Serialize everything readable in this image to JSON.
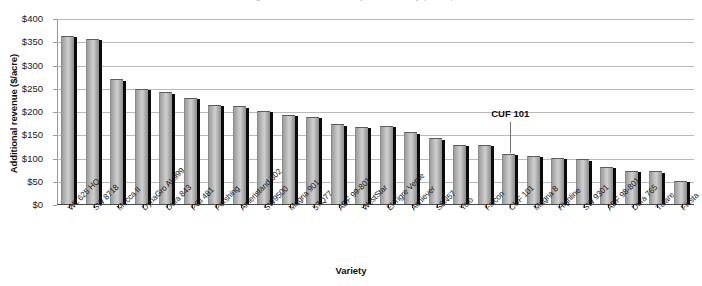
{
  "chart_data": {
    "type": "bar",
    "title": "",
    "xlabel": "Variety",
    "ylabel": "Additional revenue ($/acre)",
    "ylim": [
      0,
      400
    ],
    "ytick_step": 50,
    "ytick_labels": [
      "$0",
      "$50",
      "$100",
      "$150",
      "$200",
      "$250",
      "$300",
      "$350",
      "$400"
    ],
    "ytick_values": [
      0,
      50,
      100,
      150,
      200,
      250,
      300,
      350,
      400
    ],
    "grid": true,
    "legend": "none",
    "bar_color": "#bdbdbd",
    "bar_edge_color": "#5c5c5c",
    "bar_shadow_color": "#0b0b0b",
    "categories": [
      "WL 625 HQ",
      "SW 8718",
      "Mecca II",
      "DynaGro AL999",
      "Dura 843",
      "PGI 481",
      "Pershing",
      "Ameristand 802",
      "SW9500",
      "Magna 901",
      "57Q77",
      "ADF 99-801",
      "WestStar",
      "El Tigre Verde",
      "Achiever",
      "S8N57",
      "Yolo",
      "Falcon",
      "CUF 101",
      "Magna 8",
      "Highline",
      "SW 9301",
      "ADF 98-801",
      "Dura 765",
      "Tulare",
      "Fiesta"
    ],
    "values": [
      362,
      355,
      268,
      248,
      240,
      229,
      214,
      210,
      201,
      192,
      188,
      172,
      166,
      168,
      154,
      141,
      127,
      127,
      108,
      104,
      100,
      96,
      80,
      72,
      70,
      50
    ],
    "annotations": [
      {
        "text": "CUF 101",
        "category": "CUF 101",
        "index": 18
      }
    ]
  },
  "axes": {
    "y_title": "Additional revenue ($/acre)",
    "x_title": "Variety"
  },
  "title_sliver": "Figure. Additional revenue by alfalfa variety ($/acre)"
}
